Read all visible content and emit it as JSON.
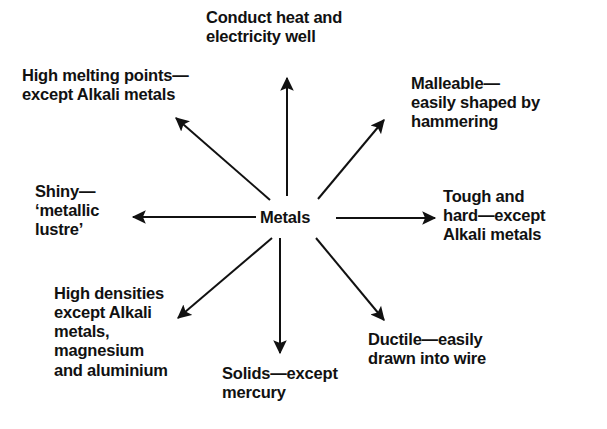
{
  "diagram": {
    "type": "spider-web",
    "title_node": "Metals",
    "background_color": "#ffffff",
    "ink_color": "#111111",
    "center": {
      "x": 300,
      "y": 218
    },
    "spokes": [
      {
        "id": "conduct",
        "direction": "up",
        "label": "Conduct heat and\nelectricity well",
        "arrow": {
          "x1": 287,
          "y1": 196,
          "x2": 287,
          "y2": 74
        }
      },
      {
        "id": "melting-points",
        "direction": "up-left",
        "label": "High melting points—\nexcept Alkali metals",
        "arrow": {
          "x1": 270,
          "y1": 200,
          "x2": 172,
          "y2": 114
        }
      },
      {
        "id": "malleable",
        "direction": "up-right",
        "label": "Malleable—\neasily shaped by hammering",
        "arrow": {
          "x1": 318,
          "y1": 199,
          "x2": 388,
          "y2": 116
        }
      },
      {
        "id": "shiny",
        "direction": "left",
        "label": "Shiny—\n‘metallic\nlustre’",
        "arrow": {
          "x1": 256,
          "y1": 217,
          "x2": 128,
          "y2": 217
        }
      },
      {
        "id": "tough-hard",
        "direction": "right",
        "label": "Tough and\nhard—except\nAlkali metals",
        "arrow": {
          "x1": 336,
          "y1": 218,
          "x2": 440,
          "y2": 218
        }
      },
      {
        "id": "high-densities",
        "direction": "down-left",
        "label": "High densities\nexcept Alkali\nmetals,\nmagnesium\nand aluminium",
        "arrow": {
          "x1": 272,
          "y1": 238,
          "x2": 173,
          "y2": 322
        }
      },
      {
        "id": "solids",
        "direction": "down",
        "label": "Solids—except\nmercury",
        "arrow": {
          "x1": 280,
          "y1": 238,
          "x2": 280,
          "y2": 358
        }
      },
      {
        "id": "ductile",
        "direction": "down-right",
        "label": "Ductile—easily\ndrawn into wire",
        "arrow": {
          "x1": 316,
          "y1": 238,
          "x2": 388,
          "y2": 325
        }
      }
    ]
  }
}
